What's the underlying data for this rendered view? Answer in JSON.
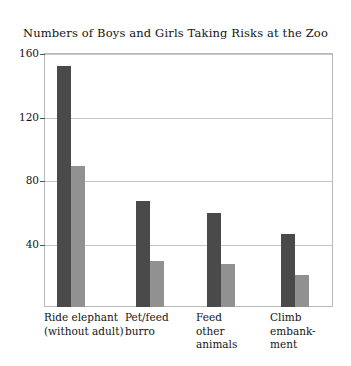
{
  "chart_data": {
    "type": "bar",
    "title": "Numbers of Boys and Girls Taking Risks at the Zoo",
    "xlabel": "",
    "ylabel": "",
    "ylim": [
      0,
      160
    ],
    "yticks": [
      40,
      80,
      120,
      160
    ],
    "ytick_labels": [
      "40",
      "80",
      "120",
      "160"
    ],
    "grid": true,
    "legend": "none",
    "categories": [
      "Ride elephant\n(without adult)",
      "Pet/feed\nburro",
      "Feed\nother\nanimals",
      "Climb\nembank-\nment"
    ],
    "series": [
      {
        "name": "Boys",
        "color": "#4a4a4a",
        "values": [
          152,
          67,
          59,
          46
        ]
      },
      {
        "name": "Girls",
        "color": "#919191",
        "values": [
          89,
          29,
          27,
          20
        ]
      }
    ]
  },
  "style": {
    "frame_color": "#b9b9b9",
    "grid_color": "#c6c6c6",
    "tick_color": "#555555",
    "text_color": "#141414",
    "background": "#ffffff"
  }
}
